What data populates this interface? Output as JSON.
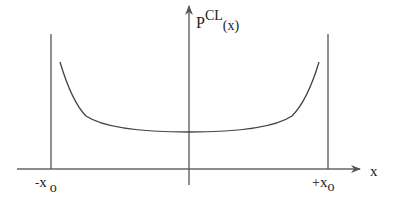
{
  "diagram": {
    "y_axis_label": {
      "base": "P",
      "superscript": "CL",
      "subscript": "(x)"
    },
    "x_axis_label": "x",
    "left_wall_label": {
      "sign": "-",
      "var": "x",
      "sub": "o"
    },
    "right_wall_label": {
      "sign": "+",
      "var": "x",
      "sub": "o"
    },
    "colors": {
      "line": "#555555",
      "text": "#222222",
      "background": "#ffffff"
    }
  }
}
